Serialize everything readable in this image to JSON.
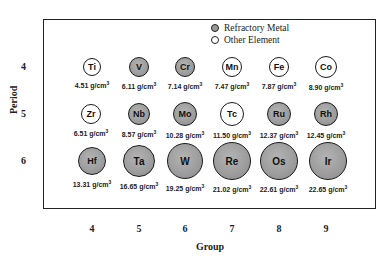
{
  "chart_data": {
    "type": "table",
    "title": "",
    "xlabel": "Group",
    "ylabel": "Period",
    "x_ticks": [
      "4",
      "5",
      "6",
      "7",
      "8",
      "9"
    ],
    "y_ticks": [
      "4",
      "5",
      "6"
    ],
    "legend": [
      {
        "label": "Refractory Metal",
        "style": "gray filled circle"
      },
      {
        "label": "Other Element",
        "style": "white open circle"
      }
    ],
    "density_unit": "g/cm3",
    "elements": [
      {
        "symbol": "Ti",
        "period": 4,
        "group": 4,
        "density": "4.51",
        "type": "other"
      },
      {
        "symbol": "V",
        "period": 4,
        "group": 5,
        "density": "6.11",
        "type": "refractory"
      },
      {
        "symbol": "Cr",
        "period": 4,
        "group": 6,
        "density": "7.14",
        "type": "refractory"
      },
      {
        "symbol": "Mn",
        "period": 4,
        "group": 7,
        "density": "7.47",
        "type": "other"
      },
      {
        "symbol": "Fe",
        "period": 4,
        "group": 8,
        "density": "7.87",
        "type": "other"
      },
      {
        "symbol": "Co",
        "period": 4,
        "group": 9,
        "density": "8.90",
        "type": "other"
      },
      {
        "symbol": "Zr",
        "period": 5,
        "group": 4,
        "density": "6.51",
        "type": "other"
      },
      {
        "symbol": "Nb",
        "period": 5,
        "group": 5,
        "density": "8.57",
        "type": "refractory"
      },
      {
        "symbol": "Mo",
        "period": 5,
        "group": 6,
        "density": "10.28",
        "type": "refractory"
      },
      {
        "symbol": "Tc",
        "period": 5,
        "group": 7,
        "density": "11.50",
        "type": "other"
      },
      {
        "symbol": "Ru",
        "period": 5,
        "group": 8,
        "density": "12.37",
        "type": "refractory"
      },
      {
        "symbol": "Rh",
        "period": 5,
        "group": 9,
        "density": "12.45",
        "type": "refractory"
      },
      {
        "symbol": "Hf",
        "period": 6,
        "group": 4,
        "density": "13.31",
        "type": "refractory"
      },
      {
        "symbol": "Ta",
        "period": 6,
        "group": 5,
        "density": "16.65",
        "type": "refractory"
      },
      {
        "symbol": "W",
        "period": 6,
        "group": 6,
        "density": "19.25",
        "type": "refractory"
      },
      {
        "symbol": "Re",
        "period": 6,
        "group": 7,
        "density": "21.02",
        "type": "refractory"
      },
      {
        "symbol": "Os",
        "period": 6,
        "group": 8,
        "density": "22.61",
        "type": "refractory"
      },
      {
        "symbol": "Ir",
        "period": 6,
        "group": 9,
        "density": "22.65",
        "type": "refractory"
      }
    ]
  },
  "legend": {
    "refractory": "Refractory Metal",
    "other": "Other Element"
  },
  "axes": {
    "xlabel": "Group",
    "ylabel": "Period",
    "groups": [
      "4",
      "5",
      "6",
      "7",
      "8",
      "9"
    ],
    "periods": [
      "4",
      "5",
      "6"
    ]
  },
  "unit_text": " g/cm",
  "unit_sup": "3",
  "cells": [
    {
      "sym": "Ti",
      "dens": "4.51",
      "kind": "other",
      "cx": 92,
      "cy": 67,
      "r": 9
    },
    {
      "sym": "V",
      "dens": "6.11",
      "kind": "refr",
      "cx": 139,
      "cy": 67,
      "r": 10
    },
    {
      "sym": "Cr",
      "dens": "7.14",
      "kind": "refr",
      "cx": 185,
      "cy": 67,
      "r": 10
    },
    {
      "sym": "Mn",
      "dens": "7.47",
      "kind": "other",
      "cx": 232,
      "cy": 67,
      "r": 10
    },
    {
      "sym": "Fe",
      "dens": "7.87",
      "kind": "other",
      "cx": 279,
      "cy": 67,
      "r": 10
    },
    {
      "sym": "Co",
      "dens": "8.90",
      "kind": "other",
      "cx": 326,
      "cy": 67,
      "r": 11
    },
    {
      "sym": "Zr",
      "dens": "6.51",
      "kind": "other",
      "cx": 91,
      "cy": 114,
      "r": 10
    },
    {
      "sym": "Nb",
      "dens": "8.57",
      "kind": "refr",
      "cx": 139,
      "cy": 114,
      "r": 11
    },
    {
      "sym": "Mo",
      "dens": "10.28",
      "kind": "refr",
      "cx": 185,
      "cy": 114,
      "r": 12
    },
    {
      "sym": "Tc",
      "dens": "11.50",
      "kind": "other",
      "cx": 232,
      "cy": 114,
      "r": 12
    },
    {
      "sym": "Ru",
      "dens": "12.37",
      "kind": "refr",
      "cx": 279,
      "cy": 114,
      "r": 12
    },
    {
      "sym": "Rh",
      "dens": "12.45",
      "kind": "refr",
      "cx": 326,
      "cy": 114,
      "r": 12
    },
    {
      "sym": "Hf",
      "dens": "13.31",
      "kind": "refr",
      "cx": 92,
      "cy": 161,
      "r": 14
    },
    {
      "sym": "Ta",
      "dens": "16.65",
      "kind": "refr",
      "cx": 139,
      "cy": 161,
      "r": 16
    },
    {
      "sym": "W",
      "dens": "19.25",
      "kind": "refr",
      "cx": 185,
      "cy": 161,
      "r": 18
    },
    {
      "sym": "Re",
      "dens": "21.02",
      "kind": "refr",
      "cx": 232,
      "cy": 161,
      "r": 19
    },
    {
      "sym": "Os",
      "dens": "22.61",
      "kind": "refr",
      "cx": 279,
      "cy": 161,
      "r": 19
    },
    {
      "sym": "Ir",
      "dens": "22.65",
      "kind": "refr",
      "cx": 328,
      "cy": 161,
      "r": 19
    }
  ]
}
